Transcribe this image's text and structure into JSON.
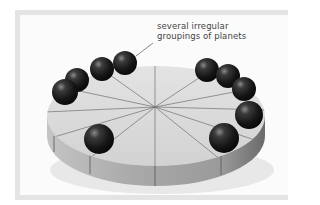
{
  "figure": {
    "annotation": {
      "line1": "several irregular",
      "line2": "groupings of planets"
    },
    "model": {
      "description": "sliced disk with spherical planets arranged around the rim",
      "slice_count": 12,
      "planet_count": 10
    },
    "colors": {
      "frame": "#e4e4e4",
      "background": "#fbfbfb",
      "disk_top": "#d9d9d9",
      "disk_side": "#a8a8a8",
      "slice_lines": "#6f6f6f",
      "planet": "#1e1e1e",
      "text": "#444444"
    }
  }
}
